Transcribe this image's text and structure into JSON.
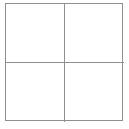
{
  "figure": {
    "name": "square-divided-into-four-quadrants",
    "background_color": "#ffffff",
    "line_color": "#8f8f8f",
    "label_color": "#3a3a3a",
    "outer_square": {
      "left": 5,
      "top": 3,
      "width": 118,
      "height": 118
    },
    "dividers": {
      "vertical_x": 64,
      "horizontal_y": 62
    },
    "quadrants": [
      {
        "id": "top-left",
        "label": ""
      },
      {
        "id": "top-right",
        "label": ""
      },
      {
        "id": "bottom-left",
        "label": "a"
      },
      {
        "id": "bottom-right",
        "label": ""
      }
    ],
    "labels": [
      {
        "text": "a",
        "quadrant": "bottom-left",
        "x": 38,
        "y": 90,
        "style": "italic"
      }
    ]
  }
}
